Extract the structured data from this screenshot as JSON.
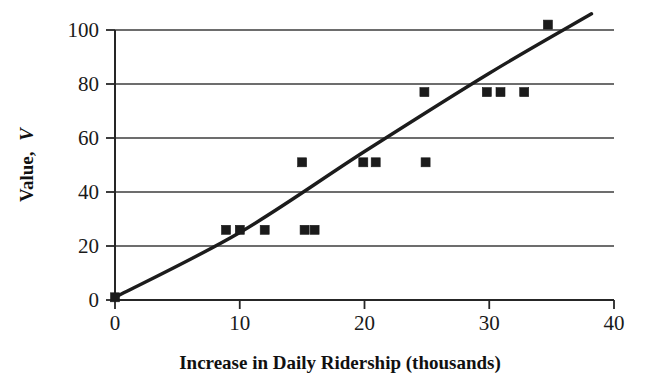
{
  "chart_data": {
    "type": "scatter",
    "title": "",
    "subtitle": "",
    "xlabel": "Increase in Daily Ridership (thousands)",
    "ylabel": "Value, V",
    "ylabel_parts": {
      "text": "Value, ",
      "italic": "V"
    },
    "xlim": [
      0,
      40
    ],
    "ylim": [
      0,
      100
    ],
    "xticks": [
      0,
      10,
      20,
      30,
      40
    ],
    "yticks": [
      0,
      20,
      40,
      60,
      80,
      100
    ],
    "xtick_labels": [
      "0",
      "10",
      "20",
      "30",
      "40"
    ],
    "ytick_labels": [
      "0",
      "20",
      "40",
      "60",
      "80",
      "100"
    ],
    "grid": "horizontal",
    "legend": "none",
    "marker_style": "filled-square",
    "marker_color": "#1b1b1b",
    "line_color": "#1c1c1c",
    "points": [
      {
        "x": 0,
        "y": 1
      },
      {
        "x": 8.9,
        "y": 26
      },
      {
        "x": 10.0,
        "y": 26
      },
      {
        "x": 12.0,
        "y": 26
      },
      {
        "x": 15.2,
        "y": 26
      },
      {
        "x": 16.0,
        "y": 26
      },
      {
        "x": 15.0,
        "y": 51
      },
      {
        "x": 19.9,
        "y": 51
      },
      {
        "x": 20.9,
        "y": 51
      },
      {
        "x": 24.9,
        "y": 51
      },
      {
        "x": 24.8,
        "y": 77
      },
      {
        "x": 29.8,
        "y": 77
      },
      {
        "x": 30.9,
        "y": 77
      },
      {
        "x": 32.8,
        "y": 77
      },
      {
        "x": 34.7,
        "y": 102
      }
    ],
    "trendline": {
      "type": "curve",
      "points": [
        {
          "x": 0,
          "y": 1
        },
        {
          "x": 10,
          "y": 25
        },
        {
          "x": 20,
          "y": 55
        },
        {
          "x": 30,
          "y": 84
        },
        {
          "x": 38.2,
          "y": 106
        }
      ]
    }
  },
  "axes": {
    "x_tick_0": "0",
    "x_tick_1": "10",
    "x_tick_2": "20",
    "x_tick_3": "30",
    "x_tick_4": "40",
    "y_tick_0": "0",
    "y_tick_1": "20",
    "y_tick_2": "40",
    "y_tick_3": "60",
    "y_tick_4": "80",
    "y_tick_5": "100",
    "x_title": "Increase in Daily Ridership (thousands)",
    "y_title_text": "Value,",
    "y_title_var": "V"
  }
}
